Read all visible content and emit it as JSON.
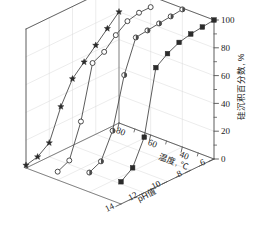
{
  "chart_data": {
    "type": "line",
    "projection": "3d",
    "title": "",
    "xlabel": "pH值",
    "ylabel": "温度, ℃",
    "zlabel": "硅沉积百分数, %",
    "xlim": [
      6,
      14
    ],
    "ylim": [
      20,
      80
    ],
    "zlim": [
      0,
      100
    ],
    "xticks": [
      6,
      8,
      10,
      12,
      14
    ],
    "yticks": [
      80,
      60,
      40
    ],
    "zticks": [
      0,
      20,
      40,
      60,
      80,
      100
    ],
    "grid": true,
    "legend_position": "none",
    "series": [
      {
        "name": "80",
        "marker": "star",
        "temperature": 80,
        "x": [
          6,
          7,
          8,
          9,
          10,
          11,
          12,
          13,
          14
        ],
        "z": [
          80,
          72,
          64,
          56,
          48,
          32,
          10,
          4,
          2
        ]
      },
      {
        "name": "60",
        "marker": "open-circle",
        "temperature": 60,
        "x": [
          6,
          7,
          8,
          9,
          10,
          11,
          12,
          13,
          14
        ],
        "z": [
          92,
          92,
          90,
          84,
          76,
          72,
          34,
          10,
          6
        ]
      },
      {
        "name": "40",
        "marker": "half-circle",
        "temperature": 40,
        "x": [
          6,
          7,
          8,
          9,
          10,
          11,
          12,
          13,
          14
        ],
        "z": [
          99,
          98,
          97,
          96,
          95,
          72,
          36,
          18,
          14
        ]
      },
      {
        "name": "20",
        "marker": "filled-square",
        "temperature": 20,
        "x": [
          6,
          7,
          8,
          9,
          10,
          11,
          12,
          13,
          14
        ],
        "z": [
          100,
          99,
          98,
          96,
          92,
          86,
          40,
          22,
          16
        ]
      }
    ]
  },
  "axes": {
    "x_tick_labels": [
      "6",
      "8",
      "10",
      "12",
      "14"
    ],
    "y_tick_labels": [
      "80",
      "60",
      "40"
    ],
    "z_tick_labels": [
      "0",
      "20",
      "40",
      "60",
      "80",
      "100"
    ],
    "x_title": "pH值",
    "y_title": "温度, ℃",
    "z_title": "硅沉积百分数, %"
  },
  "colors": {
    "axis": "#555555",
    "grid": "#d8d8d8",
    "line": "#4a4a4a",
    "marker_fill": "#2b2b2b",
    "background": "#ffffff"
  }
}
